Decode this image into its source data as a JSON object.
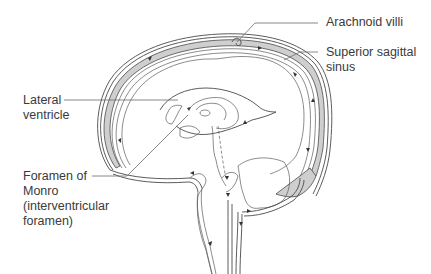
{
  "figure": {
    "type": "anatomical-diagram",
    "colors": {
      "line": "#4a4a4a",
      "sinus_fill": "#cfcfcf",
      "label_text": "#3a3a3a",
      "background": "#ffffff"
    }
  },
  "labels": {
    "arachnoid_villi": {
      "lines": [
        "Arachnoid villi"
      ]
    },
    "superior_sagittal_sinus": {
      "lines": [
        "Superior sagittal",
        "sinus"
      ]
    },
    "lateral_ventricle": {
      "lines": [
        "Lateral",
        "ventricle"
      ]
    },
    "foramen_of_monro": {
      "lines": [
        "Foramen of",
        "Monro",
        "(interventricular",
        "foramen)"
      ]
    }
  }
}
